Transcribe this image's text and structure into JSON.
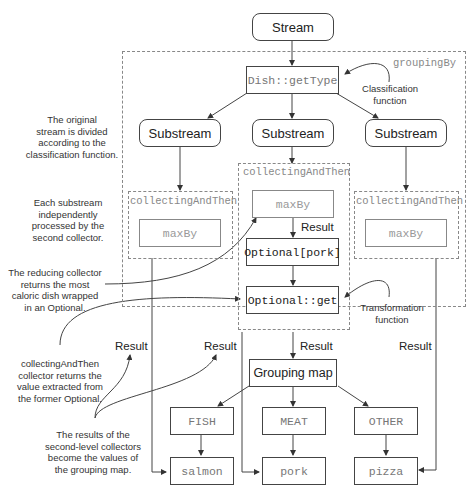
{
  "diagram": {
    "stream": "Stream",
    "classifier": "Dish::getType",
    "grouping_by_label": "groupingBy",
    "classification_function_label": "Classification\nfunction",
    "substreams": [
      "Substream",
      "Substream",
      "Substream"
    ],
    "collectors": [
      {
        "name": "collectingAndThen",
        "inner": "maxBy"
      },
      {
        "name": "collectingAndThen",
        "inner": "maxBy",
        "result_label": "Result",
        "optional": "Optional[pork]",
        "transform": "Optional::get"
      },
      {
        "name": "collectingAndThen",
        "inner": "maxBy"
      }
    ],
    "transformation_function_label": "Transformation\nfunction",
    "results": [
      "Result",
      "Result",
      "Result",
      "Result"
    ],
    "grouping_map": "Grouping map",
    "keys": [
      "FISH",
      "MEAT",
      "OTHER"
    ],
    "values": [
      "salmon",
      "pork",
      "pizza"
    ]
  },
  "annotations": {
    "original_stream": "The original\nstream is divided\naccording to the\nclassification function.",
    "each_substream": "Each substream\nindependently\nprocessed by the\nsecond collector.",
    "reducing_collector": "The reducing collector\nreturns the most\ncaloric dish wrapped\nin an Optional.",
    "collecting_and_then": "collectingAndThen\ncollector returns the\nvalue extracted from\nthe former Optional.",
    "second_level_results": "The results of the\nsecond-level collectors\nbecome the values of\nthe grouping map."
  }
}
